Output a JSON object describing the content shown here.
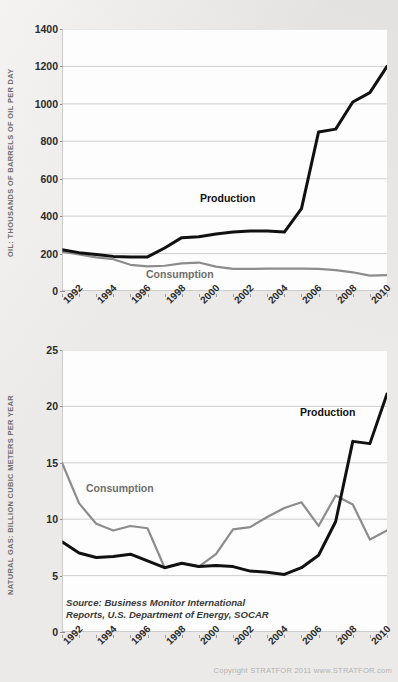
{
  "source_note": "Source: Business Monitor International\nReports, U.S. Department of Energy, SOCAR",
  "copyright": "Copyright STRATFOR 2011   www.STRATFOR.com",
  "labels": {
    "production": "Production",
    "consumption": "Consumption"
  },
  "colors": {
    "production_line": "#111111",
    "consumption_line": "#8c8c8c",
    "gridline": "#c9c9c9",
    "plot_background": "#fdfdfd",
    "page_background": "#eceae8",
    "axis_text": "#2b2b2b",
    "axis_title": "#6c6c6c"
  },
  "chart_data": [
    {
      "type": "line",
      "id": "oil",
      "title": "",
      "ylabel": "OIL: THOUSANDS OF BARRELS OF OIL PER DAY",
      "xlabel": "",
      "ylim": [
        0,
        1400
      ],
      "yticks": [
        0,
        200,
        400,
        600,
        800,
        1000,
        1200,
        1400
      ],
      "xlim": [
        1992,
        2011
      ],
      "xticks": [
        1992,
        1993,
        1994,
        1995,
        1996,
        1997,
        1998,
        1999,
        2000,
        2001,
        2002,
        2003,
        2004,
        2005,
        2006,
        2007,
        2008,
        2009,
        2010,
        2011
      ],
      "xticklabels": [
        "1992",
        "1994",
        "1996",
        "1998",
        "2000",
        "2002",
        "2004",
        "2006",
        "2008",
        "2010"
      ],
      "xticklabel_years": [
        1992,
        1994,
        1996,
        1998,
        2000,
        2002,
        2004,
        2006,
        2008,
        2010
      ],
      "grid": true,
      "legend_position": "inline-annotations",
      "x": [
        1992,
        1993,
        1994,
        1995,
        1996,
        1997,
        1998,
        1999,
        2000,
        2001,
        2002,
        2003,
        2004,
        2005,
        2006,
        2007,
        2008,
        2009,
        2010,
        2011
      ],
      "series": [
        {
          "name": "Production",
          "color": "#111111",
          "values": [
            220,
            205,
            195,
            185,
            182,
            182,
            230,
            285,
            290,
            305,
            315,
            320,
            320,
            315,
            440,
            850,
            865,
            1010,
            1060,
            1200
          ]
        },
        {
          "name": "Consumption",
          "color": "#8c8c8c",
          "values": [
            210,
            195,
            180,
            170,
            140,
            132,
            135,
            148,
            152,
            130,
            118,
            118,
            120,
            120,
            120,
            118,
            112,
            100,
            82,
            85
          ]
        }
      ]
    },
    {
      "type": "line",
      "id": "natural-gas",
      "title": "",
      "ylabel": "NATURAL GAS: BILLION CUBIC METERS PER YEAR",
      "xlabel": "",
      "ylim": [
        0,
        25
      ],
      "yticks": [
        0,
        5,
        10,
        15,
        20,
        25
      ],
      "xlim": [
        1992,
        2011
      ],
      "xticks": [
        1992,
        1993,
        1994,
        1995,
        1996,
        1997,
        1998,
        1999,
        2000,
        2001,
        2002,
        2003,
        2004,
        2005,
        2006,
        2007,
        2008,
        2009,
        2010,
        2011
      ],
      "xticklabels": [
        "1992",
        "1994",
        "1996",
        "1998",
        "2000",
        "2002",
        "2004",
        "2006",
        "2008",
        "2010"
      ],
      "xticklabel_years": [
        1992,
        1994,
        1996,
        1998,
        2000,
        2002,
        2004,
        2006,
        2008,
        2010
      ],
      "grid": true,
      "legend_position": "inline-annotations",
      "x": [
        1992,
        1993,
        1994,
        1995,
        1996,
        1997,
        1998,
        1999,
        2000,
        2001,
        2002,
        2003,
        2004,
        2005,
        2006,
        2007,
        2008,
        2009,
        2010,
        2011
      ],
      "series": [
        {
          "name": "Production",
          "color": "#111111",
          "values": [
            8.0,
            7.0,
            6.6,
            6.7,
            6.9,
            6.3,
            5.7,
            6.1,
            5.8,
            5.9,
            5.8,
            5.4,
            5.3,
            5.1,
            5.7,
            6.8,
            9.8,
            16.9,
            16.7,
            21.1
          ]
        },
        {
          "name": "Consumption",
          "color": "#8c8c8c",
          "values": [
            15.0,
            11.4,
            9.6,
            9.0,
            9.4,
            9.2,
            5.7,
            6.1,
            5.8,
            6.9,
            9.1,
            9.3,
            10.2,
            11.0,
            11.5,
            9.4,
            12.1,
            11.3,
            8.2,
            9.0
          ]
        }
      ]
    }
  ]
}
